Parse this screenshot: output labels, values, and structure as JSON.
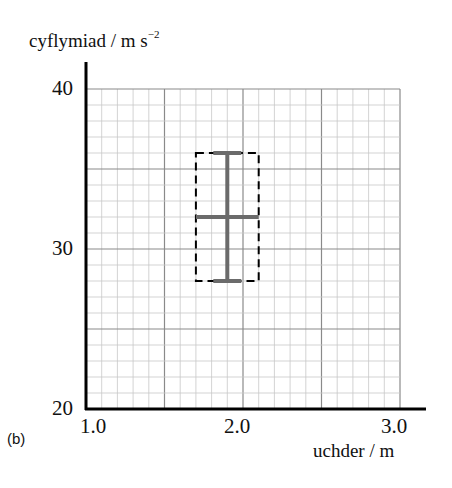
{
  "panel_label": "(b)",
  "chart_data": {
    "type": "scatter",
    "title": "",
    "xlabel": "uchder / m",
    "ylabel": "cyflymiad / m s",
    "ylabel_exponent": "−2",
    "xlim": [
      1.0,
      3.0
    ],
    "ylim": [
      20,
      40
    ],
    "x_ticks": [
      "1.0",
      "2.0",
      "3.0"
    ],
    "y_ticks": [
      "20",
      "30",
      "40"
    ],
    "grid": true,
    "grid_minor_x": 0.1,
    "grid_minor_y": 1,
    "grid_major_x": 0.5,
    "grid_major_y": 5,
    "points": [
      {
        "x": 1.9,
        "y": 32,
        "x_err": [
          1.7,
          2.1
        ],
        "y_err": [
          28,
          36
        ]
      }
    ],
    "annotations": [
      {
        "type": "dashed-rectangle",
        "x": [
          1.7,
          2.1
        ],
        "y": [
          28,
          36
        ]
      }
    ],
    "colors": {
      "error_bar": "#6b6b6b",
      "grid_minor": "#c8c8c8",
      "grid_major": "#8a8a8a",
      "axis": "#000000"
    }
  }
}
